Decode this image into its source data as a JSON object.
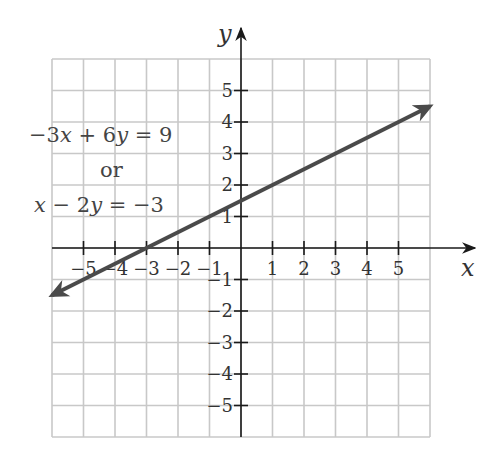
{
  "chart_data": {
    "type": "line",
    "title": "",
    "xlabel": "x",
    "ylabel": "y",
    "xlim": [
      -6,
      6
    ],
    "ylim": [
      -6,
      6
    ],
    "grid": true,
    "x_ticks": [
      -5,
      -4,
      -3,
      -2,
      -1,
      1,
      2,
      3,
      4,
      5
    ],
    "y_ticks": [
      -5,
      -4,
      -3,
      -2,
      -1,
      1,
      2,
      3,
      4,
      5
    ],
    "x_tick_labels": [
      "−5",
      "−4",
      "−3",
      "−2",
      "−1",
      "1",
      "2",
      "3",
      "4",
      "5"
    ],
    "y_tick_labels": [
      "−5",
      "−4",
      "−3",
      "−2",
      "−1",
      "1",
      "2",
      "3",
      "4",
      "5"
    ],
    "series": [
      {
        "name": "x − 2y = −3",
        "equation": "y = 0.5x + 1.5",
        "slope": 0.5,
        "intercept": 1.5,
        "x": [
          -6,
          -3,
          0,
          3,
          6
        ],
        "y": [
          -1.5,
          0,
          1.5,
          3,
          4.5
        ],
        "arrows": "both",
        "color": "#4a4a4a"
      }
    ],
    "annotations": [
      {
        "text": "−3x + 6y = 9",
        "line": 1
      },
      {
        "text": "or",
        "line": 2
      },
      {
        "text": "x − 2y = −3",
        "line": 3
      }
    ]
  },
  "labels": {
    "x_axis": "x",
    "y_axis": "y",
    "eq1": {
      "a": "−3",
      "v1": "x",
      "op": " + 6",
      "v2": "y",
      "rhs": " = 9"
    },
    "or": "or",
    "eq2": {
      "v1": "x",
      "mid": " − 2",
      "v2": "y",
      "rhs": " = −3"
    }
  },
  "colors": {
    "grid": "#c8c8c8",
    "axis": "#1a1a1a",
    "line": "#4a4a4a",
    "text": "#444444"
  }
}
